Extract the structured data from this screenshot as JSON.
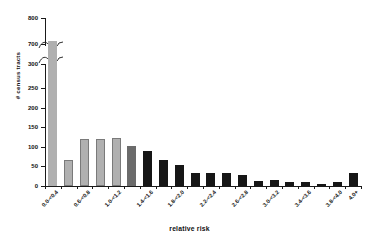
{
  "chart_data": {
    "type": "bar",
    "title": "",
    "subtitle": "",
    "xlabel": "relative risk",
    "ylabel": "# census tracts",
    "grid": false,
    "legend": "none",
    "axis_break": {
      "present": true,
      "lower_range": [
        0,
        300
      ],
      "upper_range": [
        700,
        800
      ]
    },
    "ylim": [
      0,
      800
    ],
    "ytick_labels": [
      "0",
      "50",
      "100",
      "150",
      "200",
      "250",
      "300",
      "700",
      "800"
    ],
    "ytick_values": [
      0,
      50,
      100,
      150,
      200,
      250,
      300,
      700,
      800
    ],
    "categories": [
      "0.0-<0.4",
      "0.4-<0.6",
      "0.6-<0.8",
      "0.8-<1.0",
      "1.0-<1.2",
      "1.2-<1.4",
      "1.4-<1.6",
      "1.6-<1.8",
      "1.8-<2.0",
      "2.0-<2.2",
      "2.2-<2.4",
      "2.4-<2.6",
      "2.6-<2.8",
      "2.8-<3.0",
      "3.0-<3.2",
      "3.2-<3.4",
      "3.4-<3.6",
      "3.6-<3.8",
      "3.8-<4.0",
      "4.0+"
    ],
    "visible_tick_labels": [
      "0.0-<0.4",
      "0.6-<0.8",
      "1.0-<1.2",
      "1.4-<1.6",
      "1.8-<2.0",
      "2.2-<2.4",
      "2.6-<2.8",
      "3.0-<3.2",
      "3.4-<3.6",
      "3.8-<4.0",
      "4.0+"
    ],
    "values": [
      710,
      65,
      115,
      115,
      117,
      98,
      85,
      65,
      52,
      33,
      33,
      31,
      26,
      13,
      15,
      11,
      9,
      5,
      11,
      33
    ],
    "bar_colors": [
      "#b0b0b0",
      "#b0b0b0",
      "#b0b0b0",
      "#b0b0b0",
      "#b0b0b0",
      "#6b6b6b",
      "#161616",
      "#161616",
      "#161616",
      "#161616",
      "#161616",
      "#161616",
      "#161616",
      "#161616",
      "#161616",
      "#161616",
      "#161616",
      "#161616",
      "#161616",
      "#161616"
    ],
    "colors": {
      "light_gray": "#b0b0b0",
      "mid_gray": "#6b6b6b",
      "black": "#161616",
      "axis": "#1a1a1a",
      "background": "#ffffff",
      "text": "#111111"
    }
  }
}
